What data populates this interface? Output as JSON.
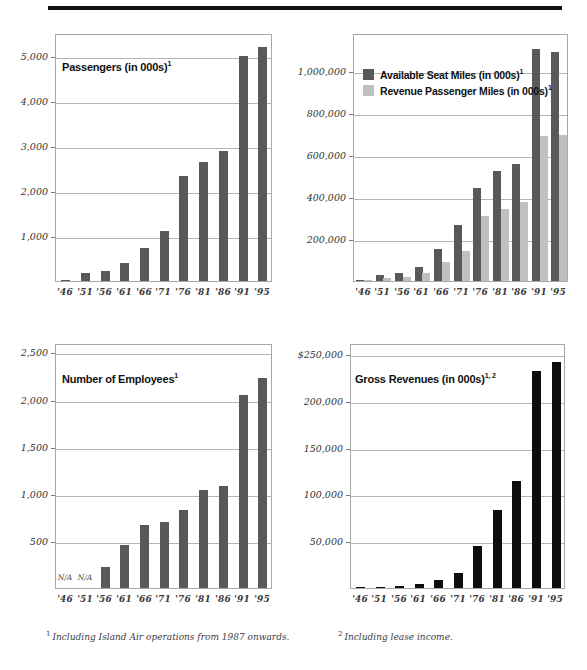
{
  "page": {
    "rule_color": "#111111"
  },
  "colors": {
    "dark_gray_bar": "#595959",
    "light_gray_bar": "#c0c0c0",
    "black_bar": "#0d0d0d",
    "gridline": "#b5b5b5",
    "frame": "#a8a8a8"
  },
  "footnotes": {
    "one_marker": "1",
    "one": "Including Island Air operations from 1987 onwards.",
    "two_marker": "2",
    "two": "Including lease income."
  },
  "chart_data": [
    {
      "id": "passengers",
      "type": "bar",
      "title": "Passengers (in 000s)",
      "title_sup": "1",
      "xlabel": "",
      "ylabel": "",
      "grid": true,
      "legend": null,
      "ylim": [
        0,
        5500
      ],
      "yticks": [
        1000,
        2000,
        3000,
        4000,
        5000
      ],
      "ytick_labels": [
        "1,000",
        "2,000",
        "3,000",
        "4,000",
        "5,000"
      ],
      "categories": [
        "'46",
        "'51",
        "'56",
        "'61",
        "'66",
        "'71",
        "'76",
        "'81",
        "'86",
        "'91",
        "'95"
      ],
      "values": [
        30,
        170,
        230,
        390,
        730,
        1110,
        2330,
        2630,
        2880,
        5000,
        5190
      ],
      "series_color": "#595959"
    },
    {
      "id": "seat-miles",
      "type": "bar",
      "title": "",
      "xlabel": "",
      "ylabel": "",
      "grid": true,
      "legend_position": "top-left",
      "ylim": [
        0,
        1180000
      ],
      "yticks": [
        200000,
        400000,
        600000,
        800000,
        1000000
      ],
      "ytick_labels": [
        "200,000",
        "400,000",
        "600,000",
        "800,000",
        "1,000,000"
      ],
      "categories": [
        "'46",
        "'51",
        "'56",
        "'61",
        "'66",
        "'71",
        "'76",
        "'81",
        "'86",
        "'91",
        "'95"
      ],
      "series": [
        {
          "name": "Available Seat Miles (in 000s)",
          "name_sup": "1",
          "color": "#595959",
          "values": [
            6000,
            28000,
            38000,
            66000,
            152000,
            266000,
            444000,
            524000,
            556000,
            1104000,
            1088000
          ]
        },
        {
          "name": "Revenue Passenger Miles (in 000s)",
          "name_sup": "1",
          "color": "#c0c0c0",
          "values": [
            3000,
            14000,
            20000,
            38000,
            92000,
            142000,
            308000,
            344000,
            378000,
            690000,
            694000
          ]
        }
      ]
    },
    {
      "id": "employees",
      "type": "bar",
      "title": "Number of Employees",
      "title_sup": "1",
      "xlabel": "",
      "ylabel": "",
      "grid": true,
      "legend": null,
      "ylim": [
        0,
        2600
      ],
      "yticks": [
        500,
        1000,
        1500,
        2000,
        2500
      ],
      "ytick_labels": [
        "500",
        "1,000",
        "1,500",
        "2,000",
        "2,500"
      ],
      "categories": [
        "'46",
        "'51",
        "'56",
        "'61",
        "'66",
        "'71",
        "'76",
        "'81",
        "'86",
        "'91",
        "'95"
      ],
      "values": [
        null,
        null,
        225,
        460,
        670,
        705,
        830,
        1035,
        1080,
        2050,
        2225
      ],
      "na_marker": "N/A",
      "series_color": "#595959"
    },
    {
      "id": "gross-revenues",
      "type": "bar",
      "title": "Gross Revenues (in 000s)",
      "title_sup": "1, 2",
      "xlabel": "",
      "ylabel": "",
      "grid": true,
      "legend": null,
      "ylim": [
        0,
        262000
      ],
      "yticks": [
        50000,
        100000,
        150000,
        200000,
        250000
      ],
      "ytick_labels": [
        "50,000",
        "100,000",
        "150,000",
        "200,000",
        "$250,000"
      ],
      "categories": [
        "'46",
        "'51",
        "'56",
        "'61",
        "'66",
        "'71",
        "'76",
        "'81",
        "'86",
        "'91",
        "'95"
      ],
      "values": [
        300,
        1400,
        1900,
        4500,
        8500,
        16500,
        44500,
        83000,
        114500,
        232500,
        241500
      ],
      "series_color": "#0d0d0d"
    }
  ]
}
